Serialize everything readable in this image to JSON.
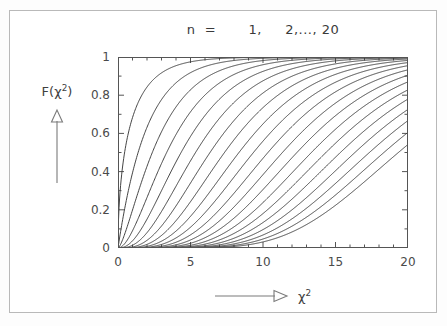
{
  "figure": {
    "title": "n  =       1,     2,..., 20",
    "background_color": "#ffffff",
    "frame_color": "#b9b9b9",
    "curve_color": "#3a3a3a",
    "axis_color": "#555555"
  },
  "axes": {
    "y_label_text": "F(χ",
    "y_label_sup": "2",
    "y_label_close": ")",
    "y_arrow_name": "up-arrow-icon",
    "x_label_text": "χ",
    "x_label_sup": "2",
    "x_arrow_name": "right-arrow-icon"
  },
  "chart_data": {
    "type": "line",
    "title": "n  =       1,     2,..., 20",
    "xlabel": "χ²",
    "ylabel": "F(χ²)",
    "xlim": [
      0,
      20
    ],
    "ylim": [
      0,
      1
    ],
    "grid": false,
    "legend": "none",
    "xticks": [
      0,
      5,
      10,
      15,
      20
    ],
    "xtick_labels": [
      "0",
      "5",
      "10",
      "15",
      "20"
    ],
    "yticks": [
      0,
      0.2,
      0.4,
      0.6,
      0.8,
      1
    ],
    "ytick_labels": [
      "0",
      "0.2",
      "0.4",
      "0.6",
      "0.8",
      "1"
    ],
    "x_minor_tick_interval": 1,
    "y_minor_tick_interval": 0.1,
    "x": [
      0,
      0.5,
      1,
      1.5,
      2,
      2.5,
      3,
      3.5,
      4,
      5,
      6,
      7,
      8,
      9,
      10,
      11,
      12,
      13,
      14,
      15,
      16,
      17,
      18,
      19,
      20
    ],
    "series": [
      {
        "name": "n = 1",
        "dof": 1,
        "values": [
          0.0,
          0.52,
          0.683,
          0.779,
          0.843,
          0.886,
          0.917,
          0.939,
          0.954,
          0.975,
          0.986,
          0.992,
          0.995,
          0.997,
          0.998,
          0.999,
          0.999,
          1.0,
          1.0,
          1.0,
          1.0,
          1.0,
          1.0,
          1.0,
          1.0
        ]
      },
      {
        "name": "n = 2",
        "dof": 2,
        "values": [
          0.0,
          0.221,
          0.393,
          0.528,
          0.632,
          0.713,
          0.777,
          0.826,
          0.865,
          0.918,
          0.95,
          0.97,
          0.982,
          0.989,
          0.993,
          0.996,
          0.998,
          0.998,
          0.999,
          0.999,
          1.0,
          1.0,
          1.0,
          1.0,
          1.0
        ]
      },
      {
        "name": "n = 3",
        "dof": 3,
        "values": [
          0.0,
          0.081,
          0.199,
          0.318,
          0.428,
          0.525,
          0.609,
          0.679,
          0.739,
          0.828,
          0.888,
          0.928,
          0.954,
          0.971,
          0.981,
          0.988,
          0.993,
          0.995,
          0.997,
          0.998,
          0.999,
          0.999,
          1.0,
          1.0,
          1.0
        ]
      },
      {
        "name": "n = 4",
        "dof": 4,
        "values": [
          0.0,
          0.026,
          0.09,
          0.173,
          0.264,
          0.355,
          0.442,
          0.522,
          0.594,
          0.713,
          0.801,
          0.864,
          0.908,
          0.939,
          0.96,
          0.973,
          0.983,
          0.989,
          0.993,
          0.995,
          0.997,
          0.998,
          0.999,
          0.999,
          0.999
        ]
      },
      {
        "name": "n = 5",
        "dof": 5,
        "values": [
          0.0,
          0.008,
          0.037,
          0.084,
          0.151,
          0.224,
          0.3,
          0.377,
          0.451,
          0.584,
          0.694,
          0.779,
          0.844,
          0.891,
          0.925,
          0.949,
          0.965,
          0.977,
          0.984,
          0.99,
          0.993,
          0.996,
          0.997,
          0.998,
          0.999
        ]
      },
      {
        "name": "n = 6",
        "dof": 6,
        "values": [
          0.0,
          0.002,
          0.014,
          0.037,
          0.08,
          0.128,
          0.191,
          0.256,
          0.323,
          0.456,
          0.577,
          0.679,
          0.762,
          0.826,
          0.875,
          0.912,
          0.938,
          0.957,
          0.97,
          0.98,
          0.986,
          0.991,
          0.994,
          0.996,
          0.997
        ]
      },
      {
        "name": "n = 7",
        "dof": 7,
        "values": [
          0.0,
          0.001,
          0.005,
          0.015,
          0.04,
          0.069,
          0.115,
          0.163,
          0.22,
          0.34,
          0.46,
          0.571,
          0.667,
          0.747,
          0.811,
          0.861,
          0.9,
          0.929,
          0.95,
          0.964,
          0.975,
          0.983,
          0.988,
          0.992,
          0.995
        ]
      },
      {
        "name": "n = 8",
        "dof": 8,
        "values": [
          0.0,
          0.0,
          0.002,
          0.006,
          0.019,
          0.036,
          0.066,
          0.099,
          0.143,
          0.242,
          0.353,
          0.463,
          0.567,
          0.658,
          0.735,
          0.799,
          0.849,
          0.889,
          0.918,
          0.941,
          0.958,
          0.97,
          0.979,
          0.985,
          0.99
        ]
      },
      {
        "name": "n = 9",
        "dof": 9,
        "values": [
          0.0,
          0.0,
          0.001,
          0.002,
          0.009,
          0.017,
          0.036,
          0.057,
          0.089,
          0.166,
          0.26,
          0.363,
          0.466,
          0.563,
          0.65,
          0.725,
          0.787,
          0.838,
          0.878,
          0.909,
          0.934,
          0.952,
          0.965,
          0.975,
          0.983
        ]
      },
      {
        "name": "n = 10",
        "dof": 10,
        "values": [
          0.0,
          0.0,
          0.0,
          0.001,
          0.004,
          0.008,
          0.019,
          0.032,
          0.053,
          0.109,
          0.185,
          0.275,
          0.371,
          0.468,
          0.56,
          0.643,
          0.715,
          0.777,
          0.827,
          0.868,
          0.9,
          0.926,
          0.945,
          0.96,
          0.971
        ]
      },
      {
        "name": "n = 11",
        "dof": 11,
        "values": [
          0.0,
          0.0,
          0.0,
          0.0,
          0.002,
          0.003,
          0.009,
          0.017,
          0.03,
          0.069,
          0.126,
          0.201,
          0.287,
          0.378,
          0.468,
          0.555,
          0.634,
          0.704,
          0.764,
          0.815,
          0.856,
          0.89,
          0.916,
          0.937,
          0.953
        ]
      },
      {
        "name": "n = 12",
        "dof": 12,
        "values": [
          0.0,
          0.0,
          0.0,
          0.0,
          0.001,
          0.002,
          0.005,
          0.009,
          0.017,
          0.042,
          0.084,
          0.142,
          0.215,
          0.297,
          0.384,
          0.47,
          0.554,
          0.631,
          0.699,
          0.759,
          0.809,
          0.851,
          0.885,
          0.912,
          0.933
        ]
      },
      {
        "name": "n = 13",
        "dof": 13,
        "values": [
          0.0,
          0.0,
          0.0,
          0.0,
          0.0,
          0.001,
          0.002,
          0.005,
          0.009,
          0.025,
          0.054,
          0.098,
          0.156,
          0.227,
          0.306,
          0.389,
          0.472,
          0.552,
          0.626,
          0.693,
          0.751,
          0.801,
          0.843,
          0.877,
          0.905
        ]
      },
      {
        "name": "n = 14",
        "dof": 14,
        "values": [
          0.0,
          0.0,
          0.0,
          0.0,
          0.0,
          0.0,
          0.001,
          0.002,
          0.005,
          0.014,
          0.034,
          0.065,
          0.109,
          0.167,
          0.235,
          0.311,
          0.39,
          0.47,
          0.547,
          0.62,
          0.685,
          0.743,
          0.793,
          0.835,
          0.871
        ]
      },
      {
        "name": "n = 15",
        "dof": 15,
        "values": [
          0.0,
          0.0,
          0.0,
          0.0,
          0.0,
          0.0,
          0.0,
          0.001,
          0.002,
          0.008,
          0.02,
          0.042,
          0.076,
          0.12,
          0.176,
          0.242,
          0.315,
          0.391,
          0.468,
          0.544,
          0.615,
          0.68,
          0.737,
          0.787,
          0.83
        ]
      },
      {
        "name": "n = 16",
        "dof": 16,
        "values": [
          0.0,
          0.0,
          0.0,
          0.0,
          0.0,
          0.0,
          0.0,
          0.0,
          0.001,
          0.004,
          0.012,
          0.026,
          0.051,
          0.084,
          0.13,
          0.185,
          0.249,
          0.319,
          0.393,
          0.468,
          0.541,
          0.611,
          0.675,
          0.732,
          0.781
        ]
      },
      {
        "name": "n = 17",
        "dof": 17,
        "values": [
          0.0,
          0.0,
          0.0,
          0.0,
          0.0,
          0.0,
          0.0,
          0.0,
          0.0,
          0.002,
          0.007,
          0.016,
          0.033,
          0.058,
          0.093,
          0.138,
          0.192,
          0.254,
          0.322,
          0.393,
          0.465,
          0.537,
          0.605,
          0.668,
          0.726
        ]
      },
      {
        "name": "n = 18",
        "dof": 18,
        "values": [
          0.0,
          0.0,
          0.0,
          0.0,
          0.0,
          0.0,
          0.0,
          0.0,
          0.0,
          0.001,
          0.004,
          0.009,
          0.021,
          0.039,
          0.065,
          0.101,
          0.145,
          0.198,
          0.259,
          0.326,
          0.395,
          0.466,
          0.535,
          0.602,
          0.665
        ]
      },
      {
        "name": "n = 19",
        "dof": 19,
        "values": [
          0.0,
          0.0,
          0.0,
          0.0,
          0.0,
          0.0,
          0.0,
          0.0,
          0.0,
          0.0,
          0.002,
          0.005,
          0.013,
          0.025,
          0.045,
          0.072,
          0.107,
          0.151,
          0.203,
          0.263,
          0.328,
          0.396,
          0.465,
          0.533,
          0.599
        ]
      },
      {
        "name": "n = 20",
        "dof": 20,
        "values": [
          0.0,
          0.0,
          0.0,
          0.0,
          0.0,
          0.0,
          0.0,
          0.0,
          0.0,
          0.0,
          0.001,
          0.003,
          0.008,
          0.016,
          0.029,
          0.049,
          0.076,
          0.112,
          0.156,
          0.209,
          0.268,
          0.332,
          0.399,
          0.466,
          0.53
        ]
      }
    ]
  }
}
